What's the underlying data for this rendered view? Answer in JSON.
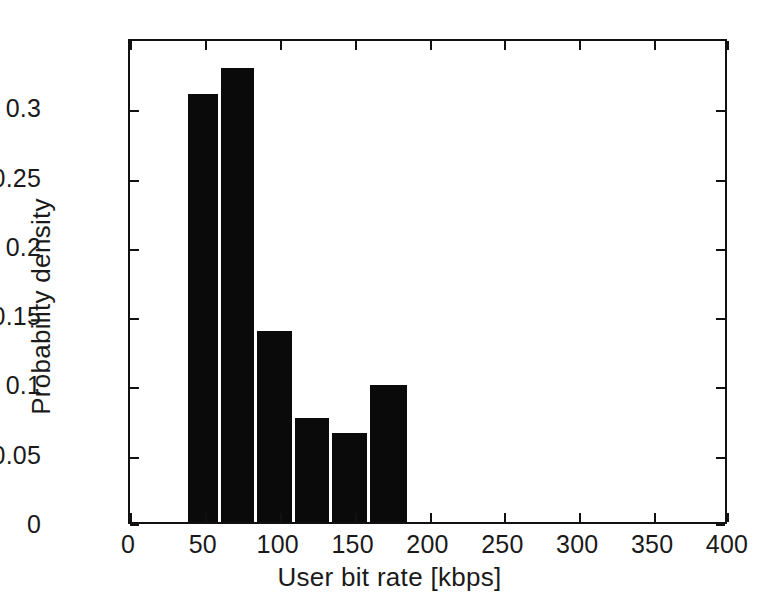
{
  "chart_data": {
    "type": "bar",
    "title": "",
    "xlabel": "User bit rate [kbps]",
    "ylabel": "Probability density",
    "xlim": [
      0,
      400
    ],
    "ylim": [
      0,
      0.35
    ],
    "grid": false,
    "legend": null,
    "xticks": [
      {
        "value": 0,
        "label": "0"
      },
      {
        "value": 50,
        "label": "50"
      },
      {
        "value": 100,
        "label": "100"
      },
      {
        "value": 150,
        "label": "150"
      },
      {
        "value": 200,
        "label": "200"
      },
      {
        "value": 250,
        "label": "250"
      },
      {
        "value": 300,
        "label": "300"
      },
      {
        "value": 350,
        "label": "350"
      },
      {
        "value": 400,
        "label": "400"
      }
    ],
    "yticks": [
      {
        "value": 0,
        "label": "0"
      },
      {
        "value": 0.05,
        "label": "0.05"
      },
      {
        "value": 0.1,
        "label": "0.1"
      },
      {
        "value": 0.15,
        "label": "0.15"
      },
      {
        "value": 0.2,
        "label": "0.2"
      },
      {
        "value": 0.25,
        "label": "0.25"
      },
      {
        "value": 0.3,
        "label": "0.3"
      }
    ],
    "bar_color": "#0a0a0a",
    "bin_edges": [
      39,
      61,
      85,
      110,
      135,
      160,
      187
    ],
    "categories": [
      "39-61",
      "61-85",
      "85-110",
      "110-135",
      "135-160",
      "160-187"
    ],
    "values": [
      0.309,
      0.328,
      0.138,
      0.075,
      0.064,
      0.099
    ],
    "bars": [
      {
        "x_start": 39,
        "x_end": 61,
        "value": 0.309
      },
      {
        "x_start": 61,
        "x_end": 85,
        "value": 0.328
      },
      {
        "x_start": 85,
        "x_end": 110,
        "value": 0.138
      },
      {
        "x_start": 110,
        "x_end": 135,
        "value": 0.075
      },
      {
        "x_start": 135,
        "x_end": 160,
        "value": 0.064
      },
      {
        "x_start": 160,
        "x_end": 187,
        "value": 0.099
      }
    ]
  }
}
